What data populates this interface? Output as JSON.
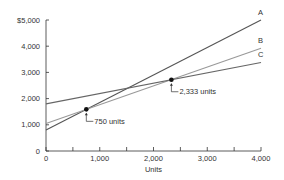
{
  "chart_data": {
    "type": "line",
    "title": "",
    "xlabel": "Units",
    "ylabel": "",
    "xlim": [
      0,
      4000
    ],
    "ylim": [
      0,
      5000
    ],
    "x_ticks": [
      0,
      1000,
      2000,
      3000,
      4000
    ],
    "x_tick_labels": [
      "0",
      "1,000",
      "2,000",
      "3,000",
      "4,000"
    ],
    "x_minor_ticks": [
      500,
      1500,
      2500,
      3500
    ],
    "y_ticks": [
      0,
      1000,
      2000,
      3000,
      4000,
      5000
    ],
    "y_tick_labels": [
      "0",
      "1,000",
      "2,000",
      "3,000",
      "4,000",
      "$5,000"
    ],
    "grid": false,
    "series": [
      {
        "name": "A",
        "x": [
          0,
          4000
        ],
        "values": [
          800,
          5000
        ],
        "color": "#555555"
      },
      {
        "name": "B",
        "x": [
          0,
          4000
        ],
        "values": [
          1050,
          3920
        ],
        "color": "#999999"
      },
      {
        "name": "C",
        "x": [
          0,
          4000
        ],
        "values": [
          1800,
          3380
        ],
        "color": "#666666"
      }
    ],
    "annotations": [
      {
        "label": "750 units",
        "x": 750,
        "y": 1590
      },
      {
        "label": "2,333 units",
        "x": 2333,
        "y": 2720
      }
    ]
  }
}
